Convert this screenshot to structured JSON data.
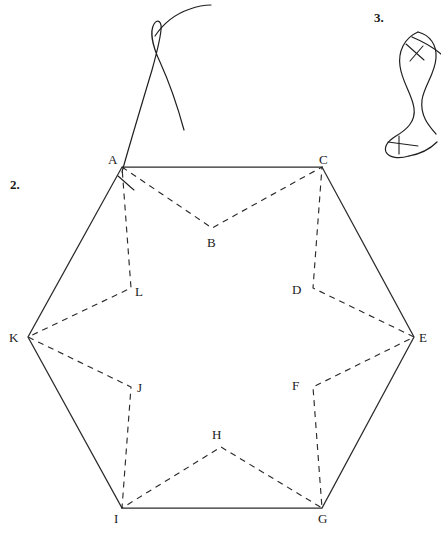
{
  "figure": {
    "background_color": "#ffffff",
    "ink_color": "#2b2b2b",
    "width": 441,
    "height": 536
  },
  "problem_numbers": [
    {
      "id": "problem-2",
      "label": "2.",
      "x": 10,
      "y": 178
    },
    {
      "id": "problem-3",
      "label": "3.",
      "x": 374,
      "y": 11
    }
  ],
  "hexagon": {
    "name": "outer-hexagon",
    "line_style": "solid",
    "vertices": [
      {
        "id": "A",
        "label": "A",
        "x": 122,
        "y": 167,
        "label_x": 108,
        "label_y": 153
      },
      {
        "id": "C",
        "label": "C",
        "x": 322,
        "y": 167,
        "label_x": 319,
        "label_y": 153
      },
      {
        "id": "E",
        "label": "E",
        "x": 414,
        "y": 337,
        "label_x": 419,
        "label_y": 331
      },
      {
        "id": "G",
        "label": "G",
        "x": 322,
        "y": 508,
        "label_x": 318,
        "label_y": 512
      },
      {
        "id": "I",
        "label": "I",
        "x": 122,
        "y": 508,
        "label_x": 114,
        "label_y": 512
      },
      {
        "id": "K",
        "label": "K",
        "x": 28,
        "y": 337,
        "label_x": 9,
        "label_y": 331
      }
    ]
  },
  "star": {
    "name": "inner-six-pointed-star",
    "line_style": "dashed",
    "vertices": [
      {
        "id": "B",
        "label": "B",
        "x": 212,
        "y": 228,
        "label_x": 207,
        "label_y": 236
      },
      {
        "id": "D",
        "label": "D",
        "x": 313,
        "y": 288,
        "label_x": 292,
        "label_y": 283
      },
      {
        "id": "F",
        "label": "F",
        "x": 313,
        "y": 387,
        "label_x": 292,
        "label_y": 379
      },
      {
        "id": "H",
        "label": "H",
        "x": 221,
        "y": 447,
        "label_x": 212,
        "label_y": 428
      },
      {
        "id": "J",
        "label": "J",
        "x": 131,
        "y": 387,
        "label_x": 137,
        "label_y": 381
      },
      {
        "id": "L",
        "label": "L",
        "x": 131,
        "y": 288,
        "label_x": 135,
        "label_y": 285
      }
    ],
    "path_order": [
      "A",
      "B",
      "C",
      "D",
      "E",
      "F",
      "G",
      "H",
      "I",
      "J",
      "K",
      "L"
    ]
  },
  "sketch_marks": [
    {
      "id": "sketch-curve-2",
      "description": "hand-drawn looped curve above vertex A",
      "near_label": "2."
    },
    {
      "id": "sketch-curve-3",
      "description": "hand-drawn S-shaped closed curve with two crossing ticks",
      "near_label": "3."
    }
  ]
}
